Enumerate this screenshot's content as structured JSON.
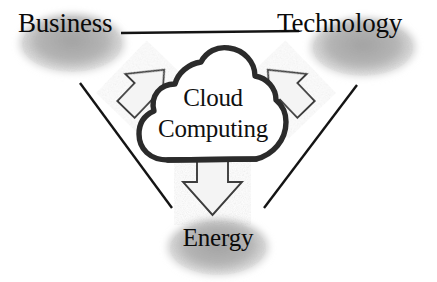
{
  "diagram": {
    "center": {
      "name": "cloud-computing",
      "line1": "Cloud",
      "line2": "Computing",
      "shape": "cloud",
      "outline_color": "#2b2b2b",
      "fill_color": "#ffffff"
    },
    "nodes": [
      {
        "id": "business",
        "label": "Business",
        "position": "top-left",
        "blob_color": "#b3b3b3"
      },
      {
        "id": "technology",
        "label": "Technology",
        "position": "top-right",
        "blob_color": "#b3b3b3"
      },
      {
        "id": "energy",
        "label": "Energy",
        "position": "bottom-center",
        "blob_color": "#b3b3b3"
      }
    ],
    "arrows": [
      {
        "id": "arrow-to-business",
        "from": "cloud-computing",
        "to": "business",
        "direction": "up-left",
        "fill_color": "#f2f2f2",
        "outline_color": "#3c3c3c"
      },
      {
        "id": "arrow-to-technology",
        "from": "cloud-computing",
        "to": "technology",
        "direction": "up-right",
        "fill_color": "#f2f2f2",
        "outline_color": "#3c3c3c"
      },
      {
        "id": "arrow-to-energy",
        "from": "cloud-computing",
        "to": "energy",
        "direction": "down",
        "fill_color": "#f2f2f2",
        "outline_color": "#3c3c3c"
      }
    ],
    "connectors": [
      {
        "id": "connector-business-technology",
        "from": "business",
        "to": "technology",
        "style": "straight-line",
        "color": "#141414"
      },
      {
        "id": "connector-business-energy",
        "from": "business",
        "to": "energy",
        "style": "straight-line",
        "color": "#141414"
      },
      {
        "id": "connector-technology-energy",
        "from": "technology",
        "to": "energy",
        "style": "straight-line",
        "color": "#141414"
      }
    ]
  }
}
